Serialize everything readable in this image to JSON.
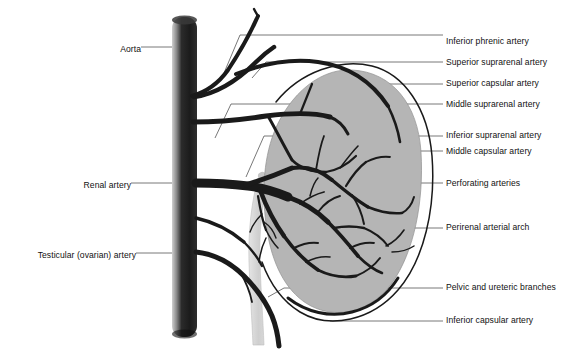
{
  "figure": {
    "width": 580,
    "height": 349,
    "background": "#ffffff"
  },
  "colors": {
    "vessel": "#1a1a1a",
    "aorta_dark": "#222222",
    "aorta_light": "#c9c9c9",
    "kidney_fill": "#b5b5b5",
    "kidney_outline": "#6f6f6f",
    "capsule_line": "#1a1a1a",
    "ureter_fill": "#d2d2d2",
    "leader_line": "#555555",
    "text": "#111111"
  },
  "structures": {
    "aorta": "aorta-cylinder",
    "kidney": "kidney-body",
    "ureter": "ureter",
    "capsule": "renal-capsule-outline",
    "arterial_tree": "renal-arterial-tree"
  },
  "labels_left": [
    {
      "id": "aorta",
      "text": "Aorta",
      "x": 103,
      "y": 50,
      "leader_from_x": 141,
      "leader_from_y": 50,
      "leader_to_x": 176,
      "leader_to_y": 50
    },
    {
      "id": "renal-artery",
      "text": "Renal artery",
      "x": 72,
      "y": 186,
      "leader_from_x": 131,
      "leader_from_y": 186,
      "leader_to_x": 196,
      "leader_to_y": 186
    },
    {
      "id": "testicular-artery",
      "text": "Testicular (ovarian) artery",
      "x": 12,
      "y": 256,
      "leader_from_x": 136,
      "leader_from_y": 256,
      "leader_to_x": 196,
      "leader_to_y": 256
    }
  ],
  "labels_right": [
    {
      "id": "inferior-phrenic-artery",
      "text": "Inferior phrenic artery",
      "x": 446,
      "y": 42,
      "tick_x1": 427,
      "tick_x2": 443
    },
    {
      "id": "superior-suprarenal-artery",
      "text": "Superior suprarenal artery",
      "x": 446,
      "y": 60,
      "tick_x1": 427,
      "tick_x2": 443
    },
    {
      "id": "superior-capsular-artery",
      "text": "Superior capsular artery",
      "x": 446,
      "y": 78,
      "tick_x1": 427,
      "tick_x2": 443
    },
    {
      "id": "middle-suprarenal-artery",
      "text": "Middle suprarenal artery",
      "x": 446,
      "y": 99,
      "tick_x1": 427,
      "tick_x2": 443
    },
    {
      "id": "inferior-suprarenal-artery",
      "text": "Inferior suprarenal artery",
      "x": 446,
      "y": 131,
      "tick_x1": 427,
      "tick_x2": 443
    },
    {
      "id": "middle-capsular-artery",
      "text": "Middle capsular artery",
      "x": 446,
      "y": 148,
      "tick_x1": 427,
      "tick_x2": 443
    },
    {
      "id": "perforating-arteries",
      "text": "Perforating arteries",
      "x": 446,
      "y": 181,
      "tick_x1": 427,
      "tick_x2": 443
    },
    {
      "id": "perirenal-arterial-arch",
      "text": "Perirenal arterial arch",
      "x": 446,
      "y": 225,
      "tick_x1": 427,
      "tick_x2": 443
    },
    {
      "id": "pelvic-ureteric-branches",
      "text": "Pelvic and ureteric branches",
      "x": 446,
      "y": 285,
      "tick_x1": 427,
      "tick_x2": 443
    },
    {
      "id": "inferior-capsular-artery",
      "text": "Inferior capsular artery",
      "x": 446,
      "y": 318,
      "tick_x1": 427,
      "tick_x2": 443
    }
  ]
}
